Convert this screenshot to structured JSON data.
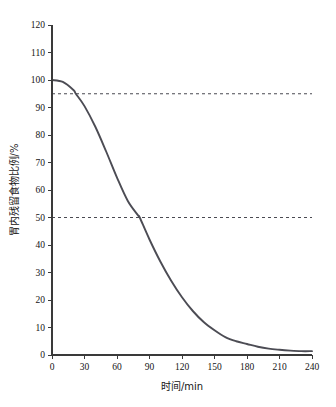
{
  "chart_data": {
    "type": "line",
    "title": "",
    "xlabel": "时间/min",
    "ylabel": "胃内残留食物比例/%",
    "xlim": [
      0,
      240
    ],
    "ylim": [
      0,
      120
    ],
    "grid": false,
    "legend": null,
    "x_ticks": [
      "0",
      "30",
      "60",
      "90",
      "120",
      "150",
      "180",
      "210",
      "240"
    ],
    "x_tick_values": [
      0,
      30,
      60,
      90,
      120,
      150,
      180,
      210,
      240
    ],
    "y_ticks": [
      "0",
      "10",
      "20",
      "30",
      "40",
      "50",
      "60",
      "70",
      "80",
      "90",
      "100",
      "110",
      "120"
    ],
    "y_tick_values": [
      0,
      10,
      20,
      30,
      40,
      50,
      60,
      70,
      80,
      90,
      100,
      110,
      120
    ],
    "series": [
      {
        "name": "胃内残留食物比例",
        "color": "#4c4c54",
        "x": [
          0,
          10,
          20,
          22,
          30,
          40,
          50,
          60,
          70,
          80,
          81,
          90,
          100,
          110,
          120,
          130,
          140,
          150,
          160,
          170,
          180,
          190,
          200,
          210,
          220,
          230,
          240
        ],
        "values": [
          100,
          99.3,
          96.3,
          95,
          90.5,
          83,
          74,
          64.5,
          56,
          50.5,
          50,
          42,
          34,
          27,
          21,
          16,
          12,
          9,
          6.5,
          5,
          4,
          3,
          2.3,
          1.9,
          1.6,
          1.4,
          1.4
        ]
      }
    ],
    "reference_lines": [
      {
        "name": "95-percent-line",
        "axis": "y",
        "value": 95,
        "style": "dashed",
        "color": "#4a4a52"
      },
      {
        "name": "50-percent-line",
        "axis": "y",
        "value": 50,
        "style": "dashed",
        "color": "#4a4a52"
      }
    ],
    "annotations": []
  }
}
